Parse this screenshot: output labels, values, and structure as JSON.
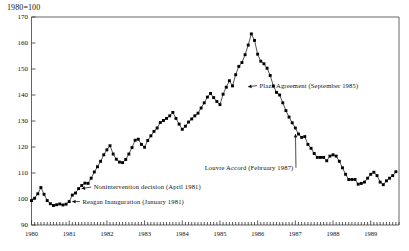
{
  "chart_data": {
    "type": "line",
    "title": "1980=100",
    "xlabel": "",
    "ylabel": "",
    "ylim": [
      90,
      170
    ],
    "xlim": [
      1980.0,
      1989.75
    ],
    "ytick_labels": [
      "90",
      "100",
      "110",
      "120",
      "130",
      "140",
      "150",
      "160",
      "170"
    ],
    "ytick_values": [
      90,
      100,
      110,
      120,
      130,
      140,
      150,
      160,
      170
    ],
    "xtick_labels": [
      "1980",
      "1981",
      "1982",
      "1983",
      "1984",
      "1985",
      "1986",
      "1987",
      "1988",
      "1989"
    ],
    "xtick_values": [
      1980,
      1981,
      1982,
      1983,
      1984,
      1985,
      1986,
      1987,
      1988,
      1989
    ],
    "grid": false,
    "legend": null,
    "minor_ticks": "monthly",
    "marker": "filled-square",
    "series": [
      {
        "name": "Nominal effective exchange rate index",
        "x": [
          1980.0,
          1980.083,
          1980.167,
          1980.25,
          1980.333,
          1980.417,
          1980.5,
          1980.583,
          1980.667,
          1980.75,
          1980.833,
          1980.917,
          1981.0,
          1981.083,
          1981.167,
          1981.25,
          1981.333,
          1981.417,
          1981.5,
          1981.583,
          1981.667,
          1981.75,
          1981.833,
          1981.917,
          1982.0,
          1982.083,
          1982.167,
          1982.25,
          1982.333,
          1982.417,
          1982.5,
          1982.583,
          1982.667,
          1982.75,
          1982.833,
          1982.917,
          1983.0,
          1983.083,
          1983.167,
          1983.25,
          1983.333,
          1983.417,
          1983.5,
          1983.583,
          1983.667,
          1983.75,
          1983.833,
          1983.917,
          1984.0,
          1984.083,
          1984.167,
          1984.25,
          1984.333,
          1984.417,
          1984.5,
          1984.583,
          1984.667,
          1984.75,
          1984.833,
          1984.917,
          1985.0,
          1985.083,
          1985.167,
          1985.25,
          1985.333,
          1985.417,
          1985.5,
          1985.583,
          1985.667,
          1985.75,
          1985.833,
          1985.917,
          1986.0,
          1986.083,
          1986.167,
          1986.25,
          1986.333,
          1986.417,
          1986.5,
          1986.583,
          1986.667,
          1986.75,
          1986.833,
          1986.917,
          1987.0,
          1987.083,
          1987.167,
          1987.25,
          1987.333,
          1987.417,
          1987.5,
          1987.583,
          1987.667,
          1987.75,
          1987.833,
          1987.917,
          1988.0,
          1988.083,
          1988.167,
          1988.25,
          1988.333,
          1988.417,
          1988.5,
          1988.583,
          1988.667,
          1988.75,
          1988.833,
          1988.917,
          1989.0,
          1989.083,
          1989.167,
          1989.25,
          1989.333,
          1989.417,
          1989.5,
          1989.583,
          1989.667
        ],
        "y": [
          99.4,
          100.3,
          102.0,
          104.4,
          101.8,
          99.4,
          98.2,
          97.5,
          97.8,
          98.1,
          97.7,
          98.0,
          99.0,
          101.5,
          102.3,
          104.0,
          105.2,
          106.1,
          106.0,
          108.0,
          110.4,
          112.4,
          114.5,
          117.0,
          118.9,
          120.5,
          117.3,
          115.3,
          114.2,
          114.0,
          115.2,
          117.3,
          119.8,
          122.6,
          123.0,
          121.0,
          119.9,
          122.5,
          124.3,
          126.0,
          127.3,
          129.4,
          130.2,
          131.0,
          132.0,
          133.3,
          131.0,
          128.8,
          126.8,
          128.0,
          129.6,
          130.8,
          132.0,
          133.0,
          135.0,
          137.0,
          139.2,
          140.6,
          139.0,
          137.5,
          136.3,
          140.3,
          143.0,
          145.5,
          143.5,
          147.8,
          151.0,
          152.5,
          155.5,
          159.2,
          163.5,
          161.0,
          155.7,
          153.0,
          152.0,
          150.3,
          147.5,
          143.5,
          141.0,
          140.0,
          137.0,
          134.0,
          131.5,
          129.3,
          127.3,
          125.0,
          123.7,
          124.0,
          121.0,
          119.5,
          117.5,
          116.0,
          116.0,
          116.0,
          114.7,
          116.5,
          117.0,
          116.5,
          114.5,
          112.0,
          109.5,
          107.5,
          107.5,
          107.5,
          105.7,
          106.0,
          106.5,
          108.0,
          109.5,
          110.3,
          109.0,
          106.5,
          105.5,
          107.0,
          108.0,
          109.0,
          110.5
        ]
      }
    ],
    "annotations": [
      {
        "id": "reagan-inauguration",
        "label": "Reagan Inauguration (January 1981)",
        "point_x": 1981.0,
        "point_y": 99.0,
        "text_x": 1981.35,
        "text_y": 99.0,
        "arrow": "left"
      },
      {
        "id": "nonintervention-decision",
        "label": "Nonintervention decision (April 1981)",
        "point_x": 1981.25,
        "point_y": 104.0,
        "text_x": 1981.65,
        "text_y": 104.6,
        "arrow": "left"
      },
      {
        "id": "plaza-agreement",
        "label": "Plaza Agreement (September 1985)",
        "point_x": 1985.667,
        "point_y": 143.2,
        "text_x": 1986.05,
        "text_y": 143.6,
        "arrow": "left"
      },
      {
        "id": "louvre-accord",
        "label": "Louvre Accord (February 1987)",
        "point_x": 1987.083,
        "point_y": 125.0,
        "text_x": 1986.95,
        "text_y": 112.0,
        "arrow": "right"
      }
    ]
  }
}
